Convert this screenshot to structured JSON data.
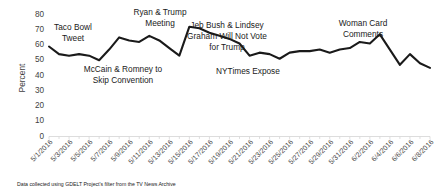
{
  "chart_data": {
    "type": "line",
    "title": "",
    "xlabel": "",
    "ylabel": "Percent",
    "ylim": [
      0,
      80
    ],
    "ytick_values": [
      0,
      10,
      20,
      30,
      40,
      50,
      60,
      70,
      80
    ],
    "ytick_labels": [
      "0",
      "10",
      "20",
      "30",
      "40",
      "50",
      "60",
      "70",
      "80"
    ],
    "grid": false,
    "legend": "none",
    "x": [
      "5/1/2016",
      "5/2/2016",
      "5/3/2016",
      "5/4/2016",
      "5/5/2016",
      "5/6/2016",
      "5/7/2016",
      "5/8/2016",
      "5/9/2016",
      "5/10/2016",
      "5/11/2016",
      "5/12/2016",
      "5/13/2016",
      "5/14/2016",
      "5/15/2016",
      "5/16/2016",
      "5/17/2016",
      "5/18/2016",
      "5/19/2016",
      "5/20/2016",
      "5/21/2016",
      "5/22/2016",
      "5/23/2016",
      "5/24/2016",
      "5/25/2016",
      "5/26/2016",
      "5/27/2016",
      "5/28/2016",
      "5/29/2016",
      "5/30/2016",
      "5/31/2016",
      "6/1/2016",
      "6/2/2016",
      "6/3/2016",
      "6/4/2016",
      "6/5/2016",
      "6/6/2016",
      "6/7/2016",
      "6/8/2016"
    ],
    "xtick_labels": [
      "5/1/2016",
      "5/3/2016",
      "5/5/2016",
      "5/7/2016",
      "5/9/2016",
      "5/11/2016",
      "5/13/2016",
      "5/15/2016",
      "5/17/2016",
      "5/19/2016",
      "5/21/2016",
      "5/23/2016",
      "5/25/2016",
      "5/27/2016",
      "5/29/2016",
      "5/31/2016",
      "6/2/2016",
      "6/4/2016",
      "6/6/2016",
      "6/8/2016"
    ],
    "series": [
      {
        "name": "Percent of TV news mentions",
        "color": "#1a1a1a",
        "values": [
          59,
          54,
          53,
          54,
          53,
          50,
          57,
          65,
          63,
          62,
          66,
          63,
          58,
          53,
          72,
          71,
          68,
          66,
          64,
          61,
          53,
          55,
          54,
          51,
          55,
          56,
          56,
          57,
          55,
          57,
          58,
          62,
          61,
          67,
          57,
          47,
          54,
          48,
          45
        ]
      }
    ],
    "annotations": [
      {
        "id": "taco-bowl-tweet",
        "lines": [
          "Taco Bowl",
          "Tweet"
        ],
        "x_anchor": "5/1/2016"
      },
      {
        "id": "mccain-romney-skip-convention",
        "lines": [
          "McCain & Romney to",
          "Skip Convention"
        ],
        "x_anchor": "5/6/2016"
      },
      {
        "id": "ryan-trump-meeting",
        "lines": [
          "Ryan & Trump",
          "Meeting"
        ],
        "x_anchor": "5/12/2016"
      },
      {
        "id": "jeb-bush-lindsey-graham",
        "lines": [
          "Jeb Bush & Lindsey",
          "Graham Will Not Vote",
          "for Trump"
        ],
        "x_anchor": "5/20/2016"
      },
      {
        "id": "nytimes-expose",
        "lines": [
          "NYTimes Expose"
        ],
        "x_anchor": "5/24/2016"
      },
      {
        "id": "woman-card-comments",
        "lines": [
          "Woman Card",
          "Comments"
        ],
        "x_anchor": "6/3/2016"
      }
    ]
  },
  "footnote": {
    "text": "Data collected using GDELT Project's filter from the TV News Archive"
  },
  "colors": {
    "series": "#1a1a1a",
    "axis": "#d9d9d9",
    "tick_text": "#4a4a4a",
    "annotation_text": "#1a1a1a",
    "background": "#ffffff"
  }
}
